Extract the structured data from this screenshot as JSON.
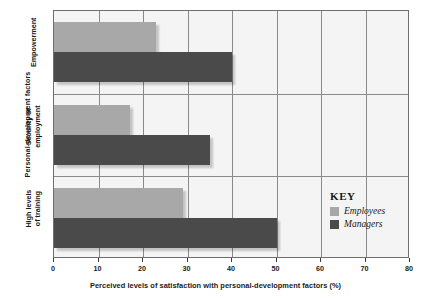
{
  "chart_data": {
    "type": "bar",
    "orientation": "horizontal",
    "title": "",
    "xlabel": "Perceived levels of satisfaction with personal-development factors (%)",
    "ylabel": "Personal-development factors",
    "categories": [
      "Empowerment",
      "Security of employment",
      "High levels of training"
    ],
    "series": [
      {
        "name": "Employees",
        "color": "#a8a8a8",
        "values": [
          23,
          17,
          29
        ]
      },
      {
        "name": "Managers",
        "color": "#4a4a4a",
        "values": [
          40,
          35,
          50
        ]
      }
    ],
    "xlim": [
      0,
      80
    ],
    "xticks": [
      0,
      10,
      20,
      30,
      40,
      50,
      60,
      70,
      80
    ],
    "xtick_labels": [
      "0",
      "10",
      "20",
      "30",
      "40",
      "50",
      "60",
      "70",
      "80"
    ],
    "grid": true,
    "grid_axis": "x",
    "legend_position": "inside-right",
    "legend_title": "KEY"
  },
  "legend": {
    "title": "KEY",
    "entries": [
      {
        "label": "Employees",
        "color": "#a8a8a8"
      },
      {
        "label": "Managers",
        "color": "#4a4a4a"
      }
    ]
  },
  "axes": {
    "x_title": "Perceived levels of satisfaction with personal-development factors (%)",
    "y_title": "Personal-development factors",
    "category_labels": [
      "Empowerment",
      "Security of\nemployment",
      "High levels\nof training"
    ]
  }
}
